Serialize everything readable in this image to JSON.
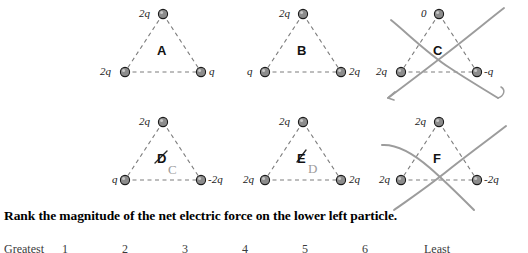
{
  "question": {
    "text": "Rank the magnitude of the net electric force on the lower left particle."
  },
  "ranking": {
    "greatest_label": "Greatest",
    "least_label": "Least",
    "numbers": [
      "1",
      "2",
      "3",
      "4",
      "5",
      "6"
    ]
  },
  "colors": {
    "particle_fill": "#8c8c8c",
    "particle_stroke": "#1a1a1a",
    "dashed_line": "#7d7d7d",
    "hand_mark": "#9c9c9c",
    "text": "#000000"
  },
  "panels": [
    {
      "id": "A",
      "letter": "A",
      "top_charge": "2q",
      "left_charge": "2q",
      "right_charge": "q",
      "crossed_out": false,
      "hand_letter": ""
    },
    {
      "id": "B",
      "letter": "B",
      "top_charge": "2q",
      "left_charge": "q",
      "right_charge": "2q",
      "crossed_out": false,
      "hand_letter": ""
    },
    {
      "id": "C",
      "letter": "C",
      "top_charge": "0",
      "left_charge": "2q",
      "right_charge": "-q",
      "crossed_out": true,
      "hand_letter": ""
    },
    {
      "id": "D",
      "letter": "D",
      "top_charge": "2q",
      "left_charge": "q",
      "right_charge": "-2q",
      "crossed_out": false,
      "hand_letter": "C"
    },
    {
      "id": "E",
      "letter": "E",
      "top_charge": "2q",
      "left_charge": "2q",
      "right_charge": "2q",
      "crossed_out": false,
      "hand_letter": "D"
    },
    {
      "id": "F",
      "letter": "F",
      "top_charge": "2q",
      "left_charge": "2q",
      "right_charge": "-2q",
      "crossed_out": true,
      "hand_letter": ""
    }
  ]
}
